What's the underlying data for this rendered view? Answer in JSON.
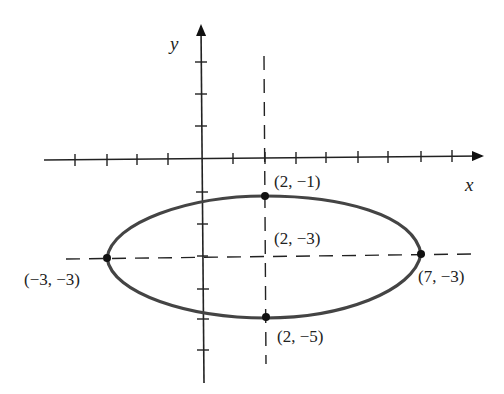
{
  "figure": {
    "axis_labels": {
      "x": "x",
      "y": "y"
    },
    "ellipse": {
      "center": [
        2,
        -3
      ],
      "semi_major": 5,
      "semi_minor": 2,
      "color": "#444444"
    },
    "points": [
      {
        "id": "top",
        "label": "(2, −1)",
        "coords": [
          2,
          -1
        ]
      },
      {
        "id": "center",
        "label": "(2, −3)",
        "coords": [
          2,
          -3
        ]
      },
      {
        "id": "left",
        "label": "(−3, −3)",
        "coords": [
          -3,
          -3
        ]
      },
      {
        "id": "right",
        "label": "(7, −3)",
        "coords": [
          7,
          -3
        ]
      },
      {
        "id": "bottom",
        "label": "(2, −5)",
        "coords": [
          2,
          -5
        ]
      }
    ],
    "guides": [
      "x = 2 (dashed vertical)",
      "y = -3 (dashed horizontal)"
    ],
    "x_ticks": [
      -4,
      -3,
      -2,
      -1,
      1,
      2,
      3,
      4,
      5,
      6,
      7,
      8
    ],
    "y_ticks": [
      3,
      2,
      1,
      -1,
      -2,
      -3,
      -4,
      -5,
      -6,
      -7
    ]
  }
}
